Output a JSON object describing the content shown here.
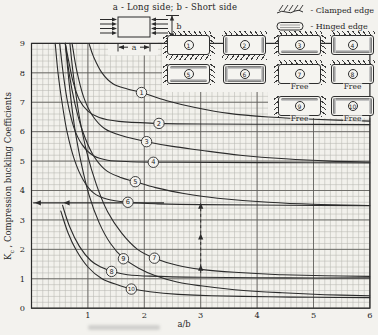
{
  "header": {
    "title": "a - Long side;  b - Short side",
    "plate": {
      "a_label": "a",
      "b_label": "b"
    },
    "legend": [
      {
        "icon": "clamped-edge-symbol",
        "label": "- Clamped edge"
      },
      {
        "icon": "hinged-edge-symbol",
        "label": "- Hinged edge"
      }
    ]
  },
  "icons": [
    {
      "num": "1",
      "top": "clamped",
      "bottom": "clamped",
      "left": "clamped",
      "right": "clamped",
      "free_label": null,
      "col": 0,
      "row": 0
    },
    {
      "num": "2",
      "top": "clamped",
      "bottom": "clamped",
      "left": "hinged",
      "right": "hinged",
      "free_label": null,
      "col": 1,
      "row": 0
    },
    {
      "num": "3",
      "top": "clamped",
      "bottom": "hinged",
      "left": "clamped",
      "right": "clamped",
      "free_label": null,
      "col": 2,
      "row": 0
    },
    {
      "num": "4",
      "top": "clamped",
      "bottom": "hinged",
      "left": "hinged",
      "right": "hinged",
      "free_label": null,
      "col": 3,
      "row": 0
    },
    {
      "num": "5",
      "top": "hinged",
      "bottom": "hinged",
      "left": "clamped",
      "right": "clamped",
      "free_label": null,
      "col": 0,
      "row": 1
    },
    {
      "num": "6",
      "top": "hinged",
      "bottom": "hinged",
      "left": "hinged",
      "right": "hinged",
      "free_label": null,
      "col": 1,
      "row": 1
    },
    {
      "num": "7",
      "top": "clamped",
      "bottom": "free",
      "left": "clamped",
      "right": "clamped",
      "free_label": "Free",
      "col": 2,
      "row": 1
    },
    {
      "num": "8",
      "top": "clamped",
      "bottom": "free",
      "left": "hinged",
      "right": "hinged",
      "free_label": "Free",
      "col": 3,
      "row": 1
    },
    {
      "num": "9",
      "top": "hinged",
      "bottom": "free",
      "left": "clamped",
      "right": "clamped",
      "free_label": "Free",
      "col": 2,
      "row": 2
    },
    {
      "num": "10",
      "top": "hinged",
      "bottom": "free",
      "left": "hinged",
      "right": "hinged",
      "free_label": "Free",
      "col": 3,
      "row": 2
    }
  ],
  "chart_data": {
    "type": "line",
    "xlabel": "a/b",
    "ylabel_main": "K",
    "ylabel_sub": "c",
    "ylabel_rest": " , Compression buckling Coefficients",
    "xlim": [
      0,
      6
    ],
    "ylim": [
      0,
      9
    ],
    "x_ticks": [
      1,
      2,
      3,
      4,
      5,
      6
    ],
    "y_ticks": [
      0,
      1,
      2,
      3,
      4,
      5,
      6,
      7,
      8,
      9
    ],
    "grid": {
      "minor_x": 0.1,
      "minor_y": 0.2,
      "major_x": 1,
      "major_y": 1
    },
    "series": [
      {
        "name": "1",
        "label_at": [
          1.95,
          7.33
        ],
        "points": [
          [
            1.02,
            9.0
          ],
          [
            1.1,
            8.55
          ],
          [
            1.25,
            8.0
          ],
          [
            1.45,
            7.62
          ],
          [
            1.7,
            7.45
          ],
          [
            1.95,
            7.33
          ],
          [
            2.4,
            7.05
          ],
          [
            2.9,
            6.82
          ],
          [
            3.5,
            6.62
          ],
          [
            4.2,
            6.5
          ],
          [
            5.0,
            6.42
          ],
          [
            6.0,
            6.36
          ]
        ]
      },
      {
        "name": "2",
        "label_at": [
          2.26,
          6.28
        ],
        "points": [
          [
            0.6,
            9.0
          ],
          [
            0.66,
            8.4
          ],
          [
            0.74,
            7.68
          ],
          [
            0.85,
            7.08
          ],
          [
            1.0,
            6.7
          ],
          [
            1.2,
            6.48
          ],
          [
            1.55,
            6.35
          ],
          [
            2.1,
            6.29
          ],
          [
            3.0,
            6.26
          ],
          [
            4.5,
            6.25
          ],
          [
            6.0,
            6.24
          ]
        ]
      },
      {
        "name": "3",
        "label_at": [
          2.04,
          5.66
        ],
        "points": [
          [
            0.72,
            9.0
          ],
          [
            0.8,
            8.1
          ],
          [
            0.92,
            7.2
          ],
          [
            1.08,
            6.55
          ],
          [
            1.3,
            6.1
          ],
          [
            1.62,
            5.85
          ],
          [
            2.04,
            5.66
          ],
          [
            2.5,
            5.5
          ],
          [
            3.0,
            5.37
          ],
          [
            3.7,
            5.2
          ],
          [
            4.5,
            5.08
          ],
          [
            5.3,
            5.0
          ],
          [
            6.0,
            4.97
          ]
        ]
      },
      {
        "name": "4",
        "label_at": [
          2.16,
          4.96
        ],
        "points": [
          [
            0.5,
            9.0
          ],
          [
            0.56,
            8.0
          ],
          [
            0.64,
            7.0
          ],
          [
            0.75,
            6.15
          ],
          [
            0.9,
            5.55
          ],
          [
            1.1,
            5.18
          ],
          [
            1.35,
            5.03
          ],
          [
            1.75,
            4.98
          ],
          [
            2.5,
            4.96
          ],
          [
            4.0,
            4.95
          ],
          [
            6.0,
            4.94
          ]
        ]
      },
      {
        "name": "5",
        "label_at": [
          1.84,
          4.3
        ],
        "points": [
          [
            0.6,
            9.0
          ],
          [
            0.67,
            7.95
          ],
          [
            0.77,
            6.95
          ],
          [
            0.9,
            6.05
          ],
          [
            1.08,
            5.25
          ],
          [
            1.3,
            4.72
          ],
          [
            1.57,
            4.45
          ],
          [
            1.84,
            4.3
          ],
          [
            2.2,
            4.1
          ],
          [
            2.7,
            3.9
          ],
          [
            3.3,
            3.74
          ],
          [
            4.2,
            3.6
          ],
          [
            5.0,
            3.53
          ],
          [
            6.0,
            3.49
          ]
        ]
      },
      {
        "name": "6",
        "label_at": [
          1.71,
          3.6
        ],
        "points": [
          [
            0.42,
            9.0
          ],
          [
            0.47,
            8.0
          ],
          [
            0.54,
            7.0
          ],
          [
            0.63,
            6.0
          ],
          [
            0.76,
            5.05
          ],
          [
            0.92,
            4.35
          ],
          [
            1.1,
            3.92
          ],
          [
            1.35,
            3.7
          ],
          [
            1.71,
            3.6
          ],
          [
            2.2,
            3.55
          ],
          [
            3.0,
            3.52
          ],
          [
            4.5,
            3.5
          ],
          [
            6.0,
            3.48
          ]
        ]
      },
      {
        "name": "7",
        "label_at": [
          2.18,
          1.7
        ],
        "points": [
          [
            0.68,
            9.0
          ],
          [
            0.75,
            7.8
          ],
          [
            0.85,
            6.5
          ],
          [
            0.98,
            5.3
          ],
          [
            1.15,
            4.2
          ],
          [
            1.35,
            3.28
          ],
          [
            1.6,
            2.55
          ],
          [
            1.88,
            2.0
          ],
          [
            2.18,
            1.7
          ],
          [
            2.6,
            1.45
          ],
          [
            3.0,
            1.32
          ],
          [
            3.6,
            1.22
          ],
          [
            4.4,
            1.14
          ],
          [
            5.2,
            1.1
          ],
          [
            6.0,
            1.08
          ]
        ]
      },
      {
        "name": "8",
        "label_at": [
          1.42,
          1.25
        ],
        "points": [
          [
            0.55,
            3.5
          ],
          [
            0.68,
            2.75
          ],
          [
            0.85,
            2.1
          ],
          [
            1.05,
            1.62
          ],
          [
            1.25,
            1.38
          ],
          [
            1.45,
            1.24
          ],
          [
            1.7,
            1.14
          ],
          [
            2.1,
            1.09
          ],
          [
            3.0,
            1.05
          ],
          [
            4.5,
            1.03
          ],
          [
            6.0,
            1.03
          ]
        ]
      },
      {
        "name": "9",
        "label_at": [
          1.63,
          1.68
        ],
        "points": [
          [
            0.6,
            9.0
          ],
          [
            0.67,
            7.6
          ],
          [
            0.76,
            6.2
          ],
          [
            0.88,
            4.95
          ],
          [
            1.02,
            3.85
          ],
          [
            1.2,
            2.9
          ],
          [
            1.4,
            2.2
          ],
          [
            1.63,
            1.7
          ],
          [
            1.9,
            1.36
          ],
          [
            2.2,
            1.1
          ],
          [
            2.6,
            0.88
          ],
          [
            3.0,
            0.76
          ],
          [
            3.6,
            0.63
          ],
          [
            4.4,
            0.53
          ],
          [
            5.2,
            0.46
          ],
          [
            6.0,
            0.42
          ]
        ]
      },
      {
        "name": "10",
        "label_at": [
          1.77,
          0.65
        ],
        "points": [
          [
            0.52,
            3.3
          ],
          [
            0.65,
            2.55
          ],
          [
            0.8,
            1.95
          ],
          [
            1.0,
            1.4
          ],
          [
            1.25,
            1.0
          ],
          [
            1.55,
            0.78
          ],
          [
            1.77,
            0.66
          ],
          [
            2.1,
            0.56
          ],
          [
            2.6,
            0.47
          ],
          [
            3.2,
            0.42
          ],
          [
            4.2,
            0.39
          ],
          [
            5.0,
            0.37
          ],
          [
            6.0,
            0.36
          ]
        ]
      }
    ],
    "annotations": {
      "asymptote_line": {
        "y": 3.58,
        "x1": 0.03,
        "x2": 2.35,
        "arrow_xs": [
          0.06,
          0.57
        ]
      },
      "dashed_arrow": {
        "x": 3.0,
        "y1": 1.2,
        "y2": 3.47,
        "arrowhead_ys": [
          1.34,
          2.4,
          3.45
        ]
      }
    }
  }
}
